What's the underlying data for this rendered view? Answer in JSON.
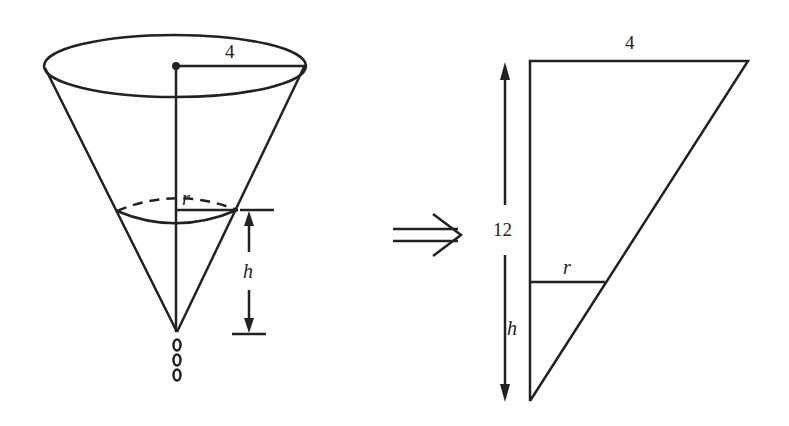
{
  "diagram": {
    "cone": {
      "top_radius_label": "4",
      "water_radius_label": "r",
      "water_height_label": "h",
      "drops": [
        "0",
        "0",
        "0"
      ]
    },
    "arrow": {
      "symbol": "⟹"
    },
    "triangle": {
      "top_label": "4",
      "height_label": "12",
      "inner_radius_label": "r",
      "inner_height_label": "h"
    },
    "colors": {
      "stroke": "#222222",
      "background": "#ffffff"
    }
  }
}
